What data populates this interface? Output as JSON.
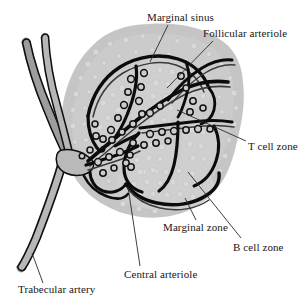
{
  "figure": {
    "type": "anatomical-line-diagram",
    "background_color": "#ffffff",
    "tissue_fill_color": "#c3c3c3",
    "tissue_light_fill_color": "#cfcfcf",
    "vessel_fill_color": "#b4b4b4",
    "vessel_outline_color": "#0d0d0d",
    "cell_light_color": "#d7d7d7",
    "cell_dark_outline_color": "#111111",
    "leader_line_color": "#2a2a2a",
    "text_color": "#161616"
  },
  "labels": [
    {
      "id": "marginal-sinus",
      "text": "Marginal sinus",
      "x": 147,
      "y": 12,
      "leader": {
        "x1": 168,
        "y1": 25,
        "x2": 150,
        "y2": 62
      }
    },
    {
      "id": "follicular-arteriole",
      "text": "Follicular arteriole",
      "x": 203,
      "y": 28,
      "leader": {
        "x1": 213,
        "y1": 41,
        "x2": 167,
        "y2": 88
      }
    },
    {
      "id": "t-cell-zone",
      "text": "T cell zone",
      "x": 248,
      "y": 141,
      "leader": {
        "x1": 246,
        "y1": 141,
        "x2": 177,
        "y2": 110
      }
    },
    {
      "id": "marginal-zone",
      "text": "Marginal zone",
      "x": 163,
      "y": 222,
      "leader": {
        "x1": 196,
        "y1": 220,
        "x2": 185,
        "y2": 198
      }
    },
    {
      "id": "b-cell-zone",
      "text": "B cell zone",
      "x": 233,
      "y": 242,
      "leader": {
        "x1": 241,
        "y1": 238,
        "x2": 188,
        "y2": 172
      }
    },
    {
      "id": "central-arteriole",
      "text": "Central arteriole",
      "x": 124,
      "y": 269,
      "leader": {
        "x1": 140,
        "y1": 266,
        "x2": 128,
        "y2": 187
      }
    },
    {
      "id": "trabecular-artery",
      "text": "Trabecular artery",
      "x": 18,
      "y": 284,
      "leader": {
        "x1": 43,
        "y1": 283,
        "x2": 32,
        "y2": 253
      }
    }
  ],
  "structures": {
    "tissue_outline": "irregular rounded white-pulp nodule",
    "trabecular_artery": "gray banded vessel entering upper-left, branching lower-left",
    "central_arteriole": "branching arteriole radiating from left hilum into compartments",
    "compartments": [
      "upper-left follicle",
      "upper-middle follicle",
      "upper-right follicle",
      "mid-left small follicle",
      "middle follicle",
      "right follicle",
      "lower-left small follicle",
      "lower large B cell follicle"
    ]
  }
}
